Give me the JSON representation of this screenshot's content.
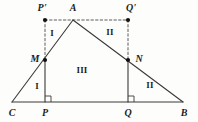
{
  "figure": {
    "type": "geometry-diagram",
    "background_color": "#fdfdfb",
    "stroke_color": "#3a3a3a",
    "dash_color": "#4a4a4a",
    "label_color": "#1c1c1c",
    "width": 198,
    "height": 122
  },
  "points": [
    {
      "id": "C",
      "label": "C",
      "x": 12,
      "y": 102,
      "label_x": 12,
      "label_y": 113,
      "dot": false
    },
    {
      "id": "P",
      "label": "P",
      "x": 45,
      "y": 102,
      "label_x": 45,
      "label_y": 113,
      "dot": false
    },
    {
      "id": "Q",
      "label": "Q",
      "x": 128,
      "y": 102,
      "label_x": 128,
      "label_y": 113,
      "dot": false
    },
    {
      "id": "B",
      "label": "B",
      "x": 183,
      "y": 102,
      "label_x": 184,
      "label_y": 113,
      "dot": false
    },
    {
      "id": "A",
      "label": "A",
      "x": 73,
      "y": 20,
      "label_x": 73,
      "label_y": 8,
      "dot": false
    },
    {
      "id": "Pp",
      "label": "P'",
      "x": 45,
      "y": 20,
      "label_x": 42,
      "label_y": 8,
      "dot": true
    },
    {
      "id": "Qp",
      "label": "Q'",
      "x": 128,
      "y": 20,
      "label_x": 131,
      "label_y": 8,
      "dot": true
    },
    {
      "id": "M",
      "label": "M",
      "x": 45,
      "y": 60,
      "label_x": 35,
      "label_y": 59,
      "dot": true
    },
    {
      "id": "N",
      "label": "N",
      "x": 128,
      "y": 60,
      "label_x": 139,
      "label_y": 59,
      "dot": true
    }
  ],
  "solid_segments": [
    {
      "name": "base-CB",
      "x1": 12,
      "y1": 102,
      "x2": 183,
      "y2": 102
    },
    {
      "name": "side-CA",
      "x1": 12,
      "y1": 102,
      "x2": 73,
      "y2": 20
    },
    {
      "name": "side-AB",
      "x1": 73,
      "y1": 20,
      "x2": 183,
      "y2": 102
    },
    {
      "name": "altitude-PM",
      "x1": 45,
      "y1": 102,
      "x2": 45,
      "y2": 60
    },
    {
      "name": "altitude-QN",
      "x1": 128,
      "y1": 102,
      "x2": 128,
      "y2": 60
    }
  ],
  "dashed_segments": [
    {
      "name": "line-PprimeQprime",
      "x1": 45,
      "y1": 20,
      "x2": 128,
      "y2": 20
    },
    {
      "name": "segment-PprimeM",
      "x1": 45,
      "y1": 20,
      "x2": 45,
      "y2": 60
    },
    {
      "name": "segment-QprimeN",
      "x1": 128,
      "y1": 20,
      "x2": 128,
      "y2": 60
    }
  ],
  "right_angles": [
    {
      "name": "right-angle-at-P",
      "x": 45,
      "y": 102,
      "size": 6,
      "dir_x": 1,
      "dir_y": -1
    },
    {
      "name": "right-angle-at-Q",
      "x": 128,
      "y": 102,
      "size": 6,
      "dir_x": 1,
      "dir_y": -1
    }
  ],
  "region_labels": [
    {
      "id": "region-I-upper",
      "text": "I",
      "x": 52,
      "y": 33
    },
    {
      "id": "region-II-upper",
      "text": "II",
      "x": 110,
      "y": 32
    },
    {
      "id": "region-III",
      "text": "III",
      "x": 82,
      "y": 70
    },
    {
      "id": "region-I-lower",
      "text": "I",
      "x": 37,
      "y": 86
    },
    {
      "id": "region-II-lower",
      "text": "II",
      "x": 150,
      "y": 85
    }
  ]
}
